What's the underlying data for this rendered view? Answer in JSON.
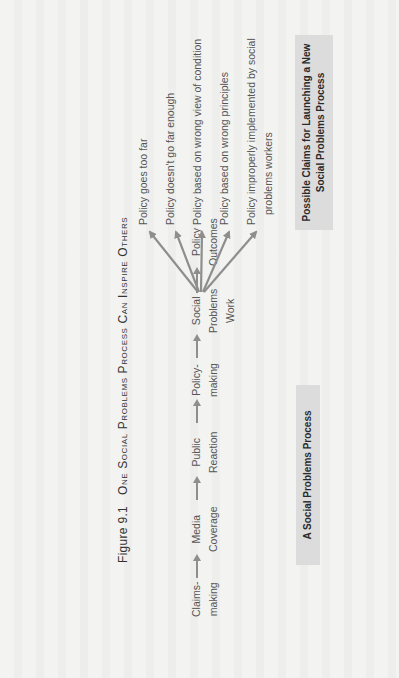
{
  "figure": {
    "label": "Figure 9.1",
    "title": "One Social Problems Process Can Inspire Others",
    "orientation": "rotated 90° counterclockwise (landscape figure on portrait page)"
  },
  "process": {
    "box_label": "A Social Problems Process",
    "steps": [
      {
        "line1": "Claims-",
        "line2": "making"
      },
      {
        "line1": "Media",
        "line2": "Coverage"
      },
      {
        "line1": "Public",
        "line2": "Reaction"
      },
      {
        "line1": "Policy-",
        "line2": "making"
      },
      {
        "line1": "Social",
        "line2": "Problems",
        "line3": "Work"
      },
      {
        "line1": "Policy",
        "line2": "Outcomes"
      }
    ]
  },
  "claims": {
    "box_label_line1": "Possible Claims for Launching a New",
    "box_label_line2": "Social Problems Process",
    "items": [
      {
        "line1": "Policy goes too far"
      },
      {
        "line1": "Policy doesn't go far enough"
      },
      {
        "line1": "Policy based on wrong view of condition"
      },
      {
        "line1": "Policy based on wrong principles"
      },
      {
        "line1": "Policy improperly implemented by social",
        "line2": "problems workers"
      }
    ]
  },
  "colors": {
    "background": "#f3f3f1",
    "arrow": "#8e8e8e",
    "box_fill": "#dcdcdc",
    "text": "#555555"
  }
}
